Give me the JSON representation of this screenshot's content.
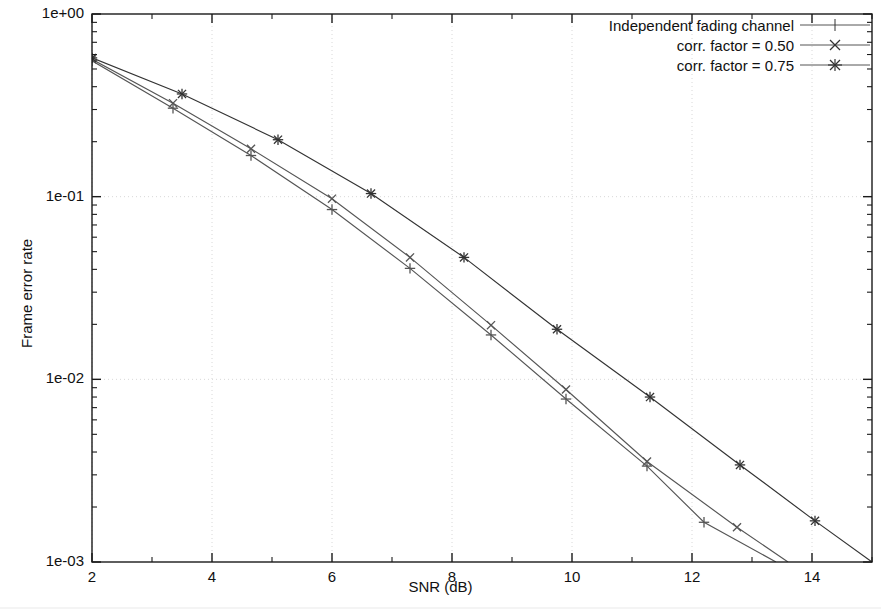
{
  "chart_data": {
    "type": "line",
    "title": "",
    "xlabel": "SNR (dB)",
    "ylabel": "Frame error rate",
    "xlim": [
      2,
      15
    ],
    "ylim": [
      0.001,
      1.0
    ],
    "yscale": "log",
    "grid": true,
    "xticks": [
      2,
      4,
      6,
      8,
      10,
      12,
      14
    ],
    "xtick_labels": [
      "2",
      "4",
      "6",
      "8",
      "10",
      "12",
      "14"
    ],
    "yticks": [
      1.0,
      0.1,
      0.01,
      0.001
    ],
    "ytick_labels": [
      "1e+00",
      "1e-01",
      "1e-02",
      "1e-03"
    ],
    "legend_position": "top-right",
    "series": [
      {
        "name": "Independent fading channel",
        "marker": "plus",
        "color": "#555555",
        "points": [
          {
            "x": 2.0,
            "y": 0.555
          },
          {
            "x": 3.35,
            "y": 0.305
          },
          {
            "x": 4.65,
            "y": 0.168
          },
          {
            "x": 6.0,
            "y": 0.085
          },
          {
            "x": 7.3,
            "y": 0.0405
          },
          {
            "x": 8.65,
            "y": 0.0175
          },
          {
            "x": 9.9,
            "y": 0.0078
          },
          {
            "x": 11.25,
            "y": 0.00335
          },
          {
            "x": 12.2,
            "y": 0.00165
          },
          {
            "x": 13.4,
            "y": 0.001
          }
        ]
      },
      {
        "name": "corr. factor = 0.50",
        "marker": "cross",
        "color": "#555555",
        "points": [
          {
            "x": 2.0,
            "y": 0.565
          },
          {
            "x": 3.35,
            "y": 0.325
          },
          {
            "x": 4.65,
            "y": 0.183
          },
          {
            "x": 6.0,
            "y": 0.0975
          },
          {
            "x": 7.3,
            "y": 0.0465
          },
          {
            "x": 8.65,
            "y": 0.0198
          },
          {
            "x": 9.9,
            "y": 0.0088
          },
          {
            "x": 11.25,
            "y": 0.00355
          },
          {
            "x": 12.75,
            "y": 0.00155
          },
          {
            "x": 13.6,
            "y": 0.001
          }
        ]
      },
      {
        "name": "corr. factor = 0.75",
        "marker": "star",
        "color": "#333333",
        "points": [
          {
            "x": 2.0,
            "y": 0.575
          },
          {
            "x": 3.5,
            "y": 0.365
          },
          {
            "x": 5.1,
            "y": 0.205
          },
          {
            "x": 6.65,
            "y": 0.104
          },
          {
            "x": 8.2,
            "y": 0.0465
          },
          {
            "x": 9.75,
            "y": 0.0188
          },
          {
            "x": 11.3,
            "y": 0.008
          },
          {
            "x": 12.8,
            "y": 0.0034
          },
          {
            "x": 14.05,
            "y": 0.00168
          },
          {
            "x": 15.0,
            "y": 0.001
          }
        ]
      }
    ]
  },
  "axes": {
    "x_title": "SNR (dB)",
    "y_title": "Frame error rate",
    "y_tick_labels": [
      "1e+00",
      "1e-01",
      "1e-02",
      "1e-03"
    ],
    "x_tick_labels": [
      "2",
      "4",
      "6",
      "8",
      "10",
      "12",
      "14"
    ]
  },
  "legend": {
    "entries": [
      {
        "label": "Independent fading channel",
        "marker": "plus-marker-icon"
      },
      {
        "label": "corr. factor = 0.50",
        "marker": "cross-marker-icon"
      },
      {
        "label": "corr. factor = 0.75",
        "marker": "star-marker-icon"
      }
    ]
  },
  "colors": {
    "axis": "#1a1a1a",
    "grid": "#d8d8d8",
    "line": "#555555",
    "background": "#ffffff"
  }
}
